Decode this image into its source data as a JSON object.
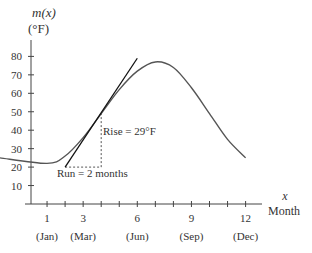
{
  "chart_data": {
    "type": "line",
    "title": "",
    "ylabel": "m(x)",
    "ylabel_unit": "(°F)",
    "xlabel": "x",
    "xlabel_sub": "Month",
    "ylim": [
      0,
      85
    ],
    "xlim": [
      0,
      13
    ],
    "yticks": [
      10,
      20,
      30,
      40,
      50,
      60,
      70,
      80
    ],
    "xticks": [
      1,
      2,
      3,
      4,
      5,
      6,
      7,
      8,
      9,
      10,
      11,
      12
    ],
    "xtick_labels": [
      {
        "x": 1,
        "num": "1",
        "month": "(Jan)"
      },
      {
        "x": 3,
        "num": "3",
        "month": "(Mar)"
      },
      {
        "x": 6,
        "num": "6",
        "month": "(Jun)"
      },
      {
        "x": 9,
        "num": "9",
        "month": "(Sep)"
      },
      {
        "x": 12,
        "num": "12",
        "month": "(Dec)"
      }
    ],
    "grid": false,
    "series": [
      {
        "name": "m(x)",
        "x": [
          0,
          1,
          2,
          3,
          4,
          5,
          6,
          7,
          8,
          9,
          10,
          11,
          12
        ],
        "values": [
          25,
          22,
          26,
          36,
          49,
          62,
          72,
          77,
          74,
          63,
          49,
          35,
          25
        ]
      }
    ],
    "tangent_line": {
      "x": [
        2,
        6
      ],
      "y": [
        20,
        79
      ],
      "point_of_tangency": {
        "x": 4,
        "y": 49
      }
    },
    "annotations": [
      {
        "text": "Rise = 29°F",
        "type": "dashed-vertical",
        "x": 4,
        "y_from": 20,
        "y_to": 49
      },
      {
        "text": "Run = 2 months",
        "type": "dashed-horizontal",
        "y": 20,
        "x_from": 2,
        "x_to": 4
      }
    ]
  },
  "labels": {
    "y_axis_title": "m(x)",
    "y_axis_unit": "(°F)",
    "x_axis_var": "x",
    "x_axis_title": "Month",
    "rise": "Rise = 29°F",
    "run": "Run = 2 months"
  }
}
